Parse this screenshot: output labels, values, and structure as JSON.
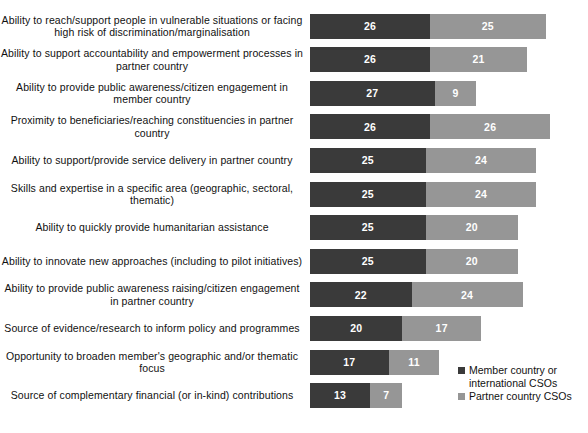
{
  "chart_data": {
    "type": "bar",
    "orientation": "horizontal",
    "stacked": true,
    "title": "",
    "subtitle": "",
    "xlabel": "",
    "ylabel": "",
    "grid": false,
    "legend_position": "bottom-right",
    "xlim": [
      0,
      55
    ],
    "categories": [
      "Ability to reach/support people in vulnerable situations or facing high risk of discrimination/marginalisation",
      "Ability to support accountability and empowerment processes in partner country",
      "Ability to provide public awareness/citizen engagement in member country",
      "Proximity to beneficiaries/reaching constituencies in partner country",
      "Ability to support/provide service delivery in partner country",
      "Skills and expertise in a specific area (geographic, sectoral, thematic)",
      "Ability to quickly provide humanitarian assistance",
      "Ability to innovate new approaches (including to pilot initiatives)",
      "Ability to provide public awareness raising/citizen engagement in partner country",
      "Source of evidence/research to inform policy and programmes",
      "Opportunity to broaden member's geographic and/or thematic focus",
      "Source of complementary financial (or in-kind) contributions"
    ],
    "series": [
      {
        "name": "Member country or international CSOs",
        "color": "#3a3a3a",
        "values": [
          26,
          26,
          27,
          26,
          25,
          25,
          25,
          25,
          22,
          20,
          17,
          13
        ]
      },
      {
        "name": "Partner country CSOs",
        "color": "#969696",
        "values": [
          25,
          21,
          9,
          26,
          24,
          24,
          20,
          20,
          24,
          17,
          11,
          7
        ]
      }
    ]
  },
  "legend": {
    "items": [
      {
        "label": "Member country or international CSOs",
        "color": "#3a3a3a"
      },
      {
        "label": "Partner country CSOs",
        "color": "#969696"
      }
    ]
  }
}
